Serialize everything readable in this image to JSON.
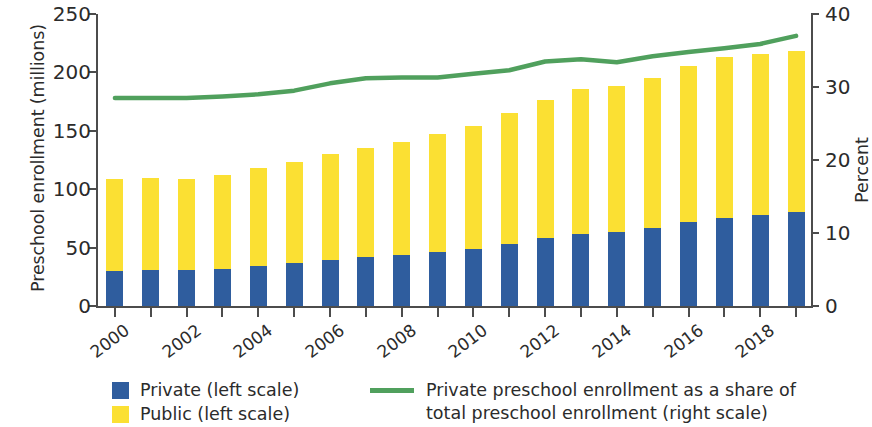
{
  "chart_data": {
    "type": "bar",
    "title": "",
    "xlabel": "",
    "ylabel": "Preschool enrollment (millions)",
    "y2label": "Percent",
    "grid": false,
    "legend_position": "bottom",
    "ylim": [
      0,
      250
    ],
    "y2lim": [
      0,
      40
    ],
    "yticks": [
      "0",
      "50",
      "100",
      "150",
      "200",
      "250"
    ],
    "y2ticks": [
      "0",
      "10",
      "20",
      "30",
      "40"
    ],
    "categories": [
      "2000",
      "2001",
      "2002",
      "2003",
      "2004",
      "2005",
      "2006",
      "2007",
      "2008",
      "2009",
      "2010",
      "2011",
      "2012",
      "2013",
      "2014",
      "2015",
      "2016",
      "2017",
      "2018",
      "2019"
    ],
    "xtick_labels": [
      "2000",
      "2002",
      "2004",
      "2006",
      "2008",
      "2010",
      "2012",
      "2014",
      "2016",
      "2018"
    ],
    "series": [
      {
        "name": "Private (left scale)",
        "type": "bar",
        "stack": "enrollment",
        "color": "#2f5d9e",
        "axis": "left",
        "values": [
          30,
          30.5,
          31,
          32,
          34,
          36.5,
          39.5,
          42,
          44,
          46.5,
          49,
          53,
          58.5,
          62,
          63,
          67,
          71.5,
          75,
          78,
          80.5
        ]
      },
      {
        "name": "Public (left scale)",
        "type": "bar",
        "stack": "enrollment",
        "color": "#fbe033",
        "axis": "left",
        "values": [
          78.5,
          79,
          78,
          80,
          84,
          86.5,
          90.5,
          93,
          96.5,
          101,
          105,
          112,
          118,
          124,
          125.5,
          128.5,
          134,
          138,
          138,
          137.5
        ]
      },
      {
        "name": "Private preschool enrollment as a share of total preschool enrollment (right scale)",
        "type": "line",
        "color": "#50a05d",
        "axis": "right",
        "values": [
          28.5,
          28.5,
          28.5,
          28.7,
          29.0,
          29.5,
          30.5,
          31.2,
          31.3,
          31.3,
          31.8,
          32.3,
          33.5,
          33.8,
          33.4,
          34.2,
          34.8,
          35.3,
          35.9,
          37.0
        ]
      }
    ]
  },
  "legend": {
    "private": "Private (left scale)",
    "public": "Public (left scale)",
    "line_line1": "Private preschool enrollment as a share of",
    "line_line2": "total preschool enrollment (right scale)"
  },
  "colors": {
    "private": "#2f5d9e",
    "public": "#fbe033",
    "line": "#50a05d",
    "axis": "#4c4c4c",
    "text": "#2b2b2b"
  }
}
